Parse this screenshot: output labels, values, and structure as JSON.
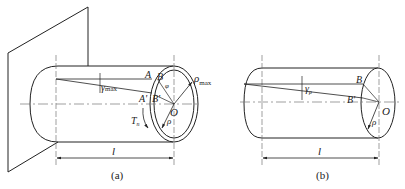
{
  "figure": {
    "panels": [
      {
        "id": "a",
        "caption": "(a)",
        "description": "Shaft fixed to wall, twisted by torque at free end (hollow ring shown on end face)",
        "labels": {
          "A": "A",
          "A_prime": "A'",
          "B": "B",
          "B_prime": "B'",
          "O": "O",
          "phi": "φ",
          "gamma_max": "γ",
          "gamma_max_sub": "max",
          "rho_max": "ρ",
          "rho_max_sub": "max",
          "rho": "ρ",
          "torque": "T",
          "torque_sub": "n",
          "length": "l"
        }
      },
      {
        "id": "b",
        "caption": "(b)",
        "description": "Inner cylinder of radius ρ isolated from the shaft",
        "labels": {
          "B": "B",
          "B_prime": "B'",
          "O": "O",
          "gamma_rho": "γ",
          "gamma_rho_sub": "ρ",
          "rho": "ρ",
          "length": "l"
        }
      }
    ],
    "colors": {
      "line": "#222222",
      "centerline": "#777777",
      "background": "#ffffff"
    }
  }
}
